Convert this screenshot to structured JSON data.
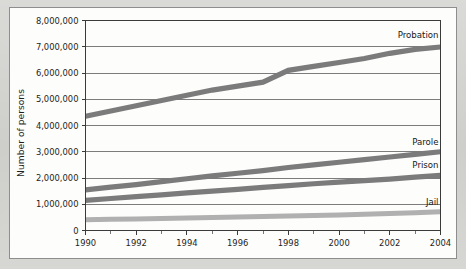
{
  "figure": {
    "background_color": "#d2d2cf",
    "panel_color": "#fdfdfc",
    "panel_border_color": "#8e8e8e"
  },
  "chart_data": {
    "type": "line",
    "title": "",
    "subtitle": "",
    "xlabel": "",
    "ylabel": "Number of persons",
    "x": [
      1990,
      1991,
      1992,
      1993,
      1994,
      1995,
      1996,
      1997,
      1998,
      1999,
      2000,
      2001,
      2002,
      2003,
      2004
    ],
    "xlim": [
      1990,
      2004
    ],
    "ylim": [
      0,
      8000000
    ],
    "grid": true,
    "grid_axis": "y",
    "legend_position": "inline-end-labels",
    "x_tick_labels": [
      "1990",
      "1992",
      "1994",
      "1996",
      "1998",
      "2000",
      "2002",
      "2004"
    ],
    "x_tick_values": [
      1990,
      1992,
      1994,
      1996,
      1998,
      2000,
      2002,
      2004
    ],
    "x_minor_tick_values": [
      1991,
      1993,
      1995,
      1997,
      1999,
      2001,
      2003
    ],
    "y_tick_labels": [
      "0",
      "1,000,000",
      "2,000,000",
      "3,000,000",
      "4,000,000",
      "5,000,000",
      "6,000,000",
      "7,000,000",
      "8,000,000"
    ],
    "y_tick_values": [
      0,
      1000000,
      2000000,
      3000000,
      4000000,
      5000000,
      6000000,
      7000000,
      8000000
    ],
    "series": [
      {
        "name": "Probation",
        "label": "Probation",
        "color": "#7b7b7b",
        "line_width": 5.2,
        "values": [
          4350000,
          4550000,
          4750000,
          4950000,
          5150000,
          5350000,
          5500000,
          5650000,
          6100000,
          6250000,
          6400000,
          6550000,
          6750000,
          6900000,
          6990000
        ]
      },
      {
        "name": "Parole",
        "label": "Parole",
        "color": "#7b7b7b",
        "line_width": 5.2,
        "values": [
          1550000,
          1650000,
          1750000,
          1860000,
          1970000,
          2080000,
          2180000,
          2280000,
          2400000,
          2500000,
          2600000,
          2700000,
          2800000,
          2900000,
          3000000
        ]
      },
      {
        "name": "Prison",
        "label": "Prison",
        "color": "#7b7b7b",
        "line_width": 5.2,
        "values": [
          1150000,
          1220000,
          1290000,
          1360000,
          1430000,
          1500000,
          1570000,
          1640000,
          1710000,
          1780000,
          1840000,
          1900000,
          1960000,
          2030000,
          2100000
        ]
      },
      {
        "name": "Jail",
        "label": "Jail",
        "color": "#b0b0b0",
        "line_width": 5.0,
        "values": [
          410000,
          425000,
          442000,
          459000,
          478000,
          497000,
          515000,
          535000,
          555000,
          575000,
          595000,
          615000,
          650000,
          680000,
          710000
        ]
      }
    ]
  }
}
